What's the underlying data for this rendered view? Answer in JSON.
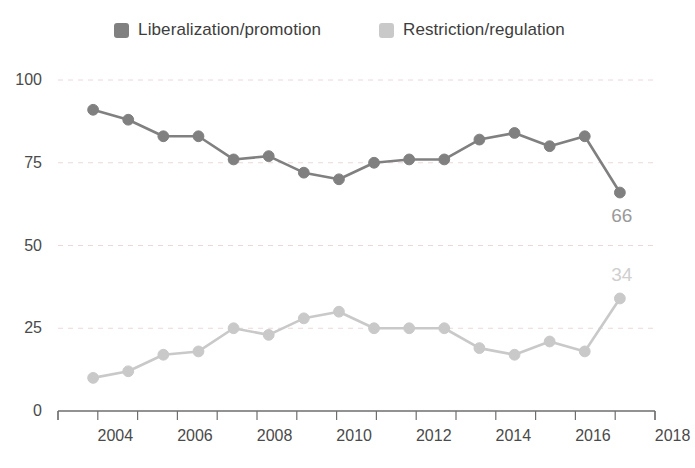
{
  "legend": {
    "items": [
      {
        "label": "Liberalization/promotion",
        "color": "#808080",
        "swatch_name": "legend-swatch-liberalization"
      },
      {
        "label": "Restriction/regulation",
        "color": "#c9c9c9",
        "swatch_name": "legend-swatch-restriction"
      }
    ]
  },
  "axes": {
    "y_ticks": [
      "0",
      "25",
      "50",
      "75",
      "100"
    ],
    "x_ticks_labeled": [
      "2004",
      "2006",
      "2008",
      "2010",
      "2012",
      "2014",
      "2016",
      "2018"
    ]
  },
  "end_labels": {
    "top": "66",
    "bottom": "34"
  },
  "chart_data": {
    "type": "line",
    "title": "",
    "subtitle": "",
    "xlabel": "",
    "ylabel": "",
    "xlim": [
      2002.5,
      2018.5
    ],
    "ylim": [
      0,
      100
    ],
    "ytick_values": [
      0,
      25,
      50,
      75,
      100
    ],
    "xtick_values": [
      2003,
      2004,
      2005,
      2006,
      2007,
      2008,
      2009,
      2010,
      2011,
      2012,
      2013,
      2014,
      2015,
      2016,
      2017,
      2018
    ],
    "xtick_labels_shown": [
      2004,
      2006,
      2008,
      2010,
      2012,
      2014,
      2016,
      2018
    ],
    "grid": "horizontal-dashed",
    "legend_position": "top-center",
    "x": [
      2003,
      2004,
      2005,
      2006,
      2007,
      2008,
      2009,
      2010,
      2011,
      2012,
      2013,
      2014,
      2015,
      2016,
      2017,
      2018
    ],
    "series": [
      {
        "name": "Liberalization/promotion",
        "color": "#808080",
        "values": [
          91,
          88,
          83,
          83,
          76,
          77,
          72,
          70,
          75,
          76,
          76,
          82,
          84,
          80,
          83,
          66
        ],
        "end_label": "66"
      },
      {
        "name": "Restriction/regulation",
        "color": "#c9c9c9",
        "values": [
          10,
          12,
          17,
          18,
          25,
          23,
          28,
          30,
          25,
          25,
          25,
          19,
          17,
          21,
          18,
          34
        ],
        "end_label": "34"
      }
    ],
    "annotations": [
      {
        "text": "66",
        "series": "Liberalization/promotion",
        "x": 2018,
        "y": 66
      },
      {
        "text": "34",
        "series": "Restriction/regulation",
        "x": 2018,
        "y": 34
      }
    ]
  }
}
